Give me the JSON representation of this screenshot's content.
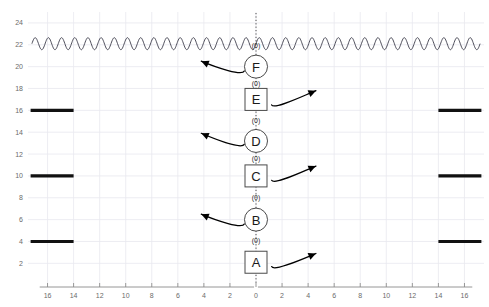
{
  "chart_data": {
    "type": "diagram",
    "title": "",
    "xlabel": "",
    "ylabel": "",
    "xlim": [
      -17.5,
      17.5
    ],
    "ylim": [
      0.2,
      25.0
    ],
    "grid": true,
    "legend_position": "none",
    "y_ticks": [
      24,
      22,
      20,
      18,
      16,
      14,
      12,
      10,
      8,
      6,
      4,
      2
    ],
    "y_tick_labels": [
      "24",
      "22",
      "20",
      "18",
      "16",
      "14",
      "12",
      "10",
      "8",
      "6",
      "4",
      "2"
    ],
    "x_ticks_left": [
      16,
      14,
      12,
      10,
      8,
      6,
      4,
      2,
      0
    ],
    "x_tick_labels_left": [
      "16",
      "14",
      "12",
      "10",
      "8",
      "6",
      "4",
      "2",
      "0"
    ],
    "x_ticks_right": [
      0,
      2,
      4,
      6,
      8,
      10,
      12,
      14,
      16
    ],
    "x_tick_labels_right": [
      "0",
      "2",
      "4",
      "6",
      "8",
      "10",
      "12",
      "14",
      "16"
    ],
    "center_chain": {
      "axis_x": 0,
      "nodes": [
        {
          "id": "A",
          "label": "A",
          "shape": "square",
          "y": 2.1
        },
        {
          "id": "B",
          "label": "B",
          "shape": "circle",
          "y": 6.0
        },
        {
          "id": "C",
          "label": "C",
          "shape": "square",
          "y": 10.0
        },
        {
          "id": "D",
          "label": "D",
          "shape": "circle",
          "y": 13.2
        },
        {
          "id": "E",
          "label": "E",
          "shape": "square",
          "y": 17.0
        },
        {
          "id": "F",
          "label": "F",
          "shape": "circle",
          "y": 20.0
        }
      ],
      "connectors": [
        {
          "label": "(0)",
          "y": 4.05
        },
        {
          "label": "(0)",
          "y": 8.0
        },
        {
          "label": "(0)",
          "y": 11.6
        },
        {
          "label": "(0)",
          "y": 15.1
        },
        {
          "label": "(0)",
          "y": 18.5
        },
        {
          "label": "(0)",
          "y": 21.9
        }
      ]
    },
    "wave": {
      "y_center": 22.1,
      "amplitude": 0.55,
      "cycles": 34,
      "x_start": -17.2,
      "x_end": 17.2
    },
    "bars_left": [
      {
        "y": 16,
        "x_start": -17.3,
        "x_end": -14.0
      },
      {
        "y": 10,
        "x_start": -17.3,
        "x_end": -14.0
      },
      {
        "y": 4,
        "x_start": -17.3,
        "x_end": -14.0
      }
    ],
    "bars_right": [
      {
        "y": 16,
        "x_start": 14.0,
        "x_end": 17.3
      },
      {
        "y": 10,
        "x_start": 14.0,
        "x_end": 17.3
      },
      {
        "y": 4,
        "x_start": 14.0,
        "x_end": 17.3
      }
    ],
    "arrows": [
      {
        "direction": "left",
        "target_node": "F",
        "tail_x": -0.9,
        "tail_y": 19.6,
        "head_x": -4.2,
        "head_y": 20.5
      },
      {
        "direction": "right",
        "target_node": "E",
        "tail_x": 1.2,
        "tail_y": 16.5,
        "head_x": 4.6,
        "head_y": 17.8
      },
      {
        "direction": "left",
        "target_node": "D",
        "tail_x": -0.9,
        "tail_y": 12.9,
        "head_x": -4.2,
        "head_y": 13.9
      },
      {
        "direction": "right",
        "target_node": "C",
        "tail_x": 1.2,
        "tail_y": 9.6,
        "head_x": 4.6,
        "head_y": 10.9
      },
      {
        "direction": "left",
        "target_node": "B",
        "tail_x": -0.9,
        "tail_y": 5.6,
        "head_x": -4.2,
        "head_y": 6.5
      },
      {
        "direction": "right",
        "target_node": "A",
        "tail_x": 1.2,
        "tail_y": 1.7,
        "head_x": 4.6,
        "head_y": 2.9
      }
    ],
    "colors": {
      "bar": "#111111",
      "wave": "#3a3a48",
      "grid": "#e9e9ef",
      "axis": "#8a8a8a",
      "tick_text": "#6b6b6b",
      "node_stroke": "#4a4a4a",
      "node_fill": "#ffffff",
      "node_text": "#1a1a1a",
      "arrow": "#000000",
      "spine": "#3a3a3a"
    }
  }
}
